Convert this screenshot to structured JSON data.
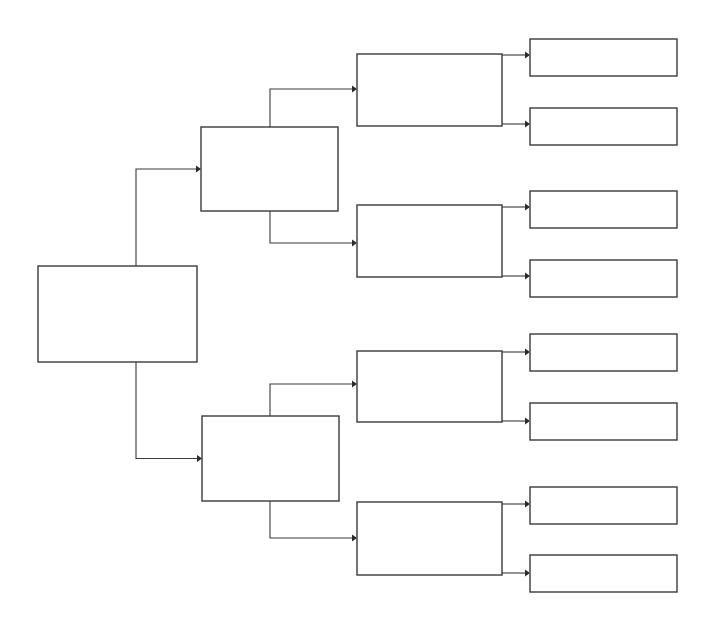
{
  "diagram": {
    "type": "tree-bracket",
    "title": "",
    "stroke_color": "#3a3a3a",
    "background": "#ffffff",
    "orientation": "left-to-right",
    "levels": 4,
    "root": {
      "label": "",
      "x": 38,
      "y": 266,
      "w": 159,
      "h": 96
    },
    "level2": [
      {
        "label": "",
        "x": 201,
        "y": 127,
        "w": 137,
        "h": 84
      },
      {
        "label": "",
        "x": 202,
        "y": 416,
        "w": 137,
        "h": 85
      }
    ],
    "level3": [
      {
        "label": "",
        "x": 357,
        "y": 54,
        "w": 145,
        "h": 72
      },
      {
        "label": "",
        "x": 357,
        "y": 205,
        "w": 145,
        "h": 72
      },
      {
        "label": "",
        "x": 357,
        "y": 351,
        "w": 145,
        "h": 71
      },
      {
        "label": "",
        "x": 357,
        "y": 502,
        "w": 145,
        "h": 73
      }
    ],
    "level4": [
      {
        "label": "",
        "x": 530,
        "y": 39,
        "w": 147,
        "h": 37
      },
      {
        "label": "",
        "x": 530,
        "y": 108,
        "w": 147,
        "h": 37
      },
      {
        "label": "",
        "x": 530,
        "y": 191,
        "w": 147,
        "h": 37
      },
      {
        "label": "",
        "x": 530,
        "y": 260,
        "w": 147,
        "h": 37
      },
      {
        "label": "",
        "x": 530,
        "y": 334,
        "w": 147,
        "h": 37
      },
      {
        "label": "",
        "x": 530,
        "y": 403,
        "w": 147,
        "h": 37
      },
      {
        "label": "",
        "x": 530,
        "y": 487,
        "w": 147,
        "h": 37
      },
      {
        "label": "",
        "x": 530,
        "y": 555,
        "w": 147,
        "h": 37
      }
    ]
  }
}
